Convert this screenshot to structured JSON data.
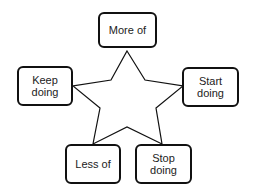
{
  "diagram": {
    "type": "starfish-retrospective",
    "center_shape": "star",
    "boxes": [
      {
        "id": "more-of",
        "lines": [
          "More of"
        ]
      },
      {
        "id": "keep-doing",
        "lines": [
          "Keep",
          "doing"
        ]
      },
      {
        "id": "start-doing",
        "lines": [
          "Start",
          "doing"
        ]
      },
      {
        "id": "less-of",
        "lines": [
          "Less of"
        ]
      },
      {
        "id": "stop-doing",
        "lines": [
          "Stop",
          "doing"
        ]
      }
    ],
    "colors": {
      "stroke": "#111111",
      "text": "#222222",
      "background": "#ffffff"
    }
  }
}
